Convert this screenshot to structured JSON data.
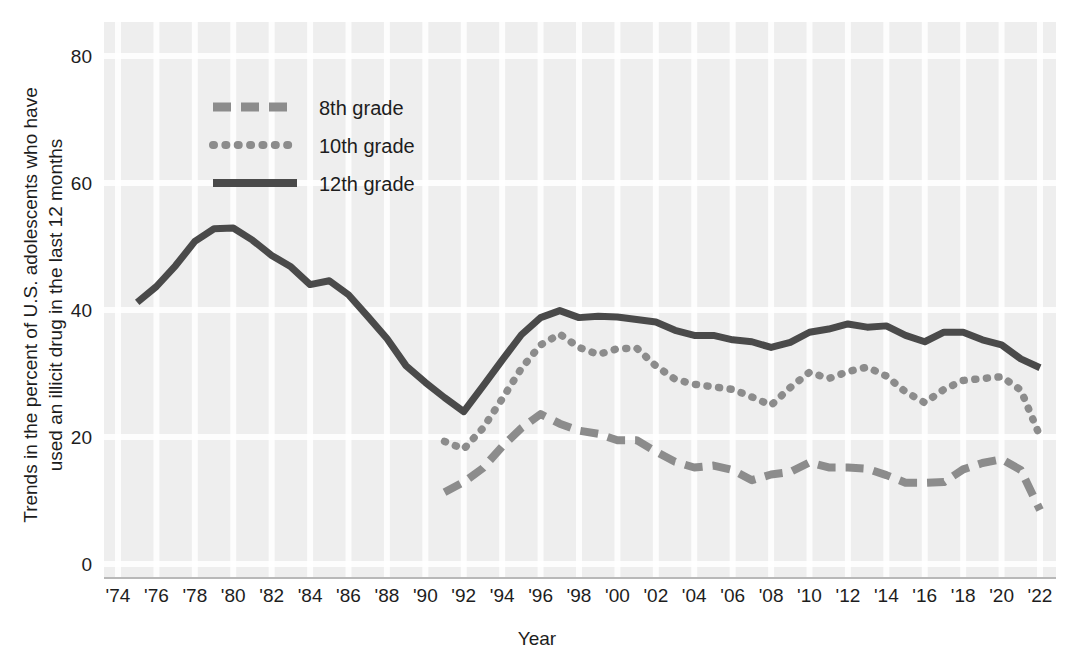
{
  "chart_data": {
    "type": "line",
    "title": "",
    "xlabel": "Year",
    "ylabel": "Trends in the percent of U.S. adolescents  who have used an illicit drug in the last 12 months",
    "ylabel_line1": "Trends in the percent of U.S. adolescents  who have",
    "ylabel_line2": "used an illicit drug in the last 12 months",
    "xlim": [
      1974,
      2022
    ],
    "ylim": [
      0,
      80
    ],
    "yticks": [
      0,
      20,
      40,
      60,
      80
    ],
    "ytick_labels": [
      "0",
      "20",
      "40",
      "60",
      "80"
    ],
    "xticks": [
      1974,
      1976,
      1978,
      1980,
      1982,
      1984,
      1986,
      1988,
      1990,
      1992,
      1994,
      1996,
      1998,
      2000,
      2002,
      2004,
      2006,
      2008,
      2010,
      2012,
      2014,
      2016,
      2018,
      2020,
      2022
    ],
    "xtick_labels": [
      "'74",
      "'76",
      "'78",
      "'80",
      "'82",
      "'84",
      "'86",
      "'88",
      "'90",
      "'92",
      "'94",
      "'96",
      "'98",
      "'00",
      "'02",
      "'04",
      "'06",
      "'08",
      "'10",
      "'12",
      "'14",
      "'16",
      "'18",
      "'20",
      "'22"
    ],
    "grid": true,
    "grid_color": "#ffffff",
    "plot_background": "#eeeeee",
    "legend_position": "top-left",
    "series": [
      {
        "name": "8th grade",
        "style": "dashed",
        "color": "#8c8c8c",
        "x": [
          1991,
          1992,
          1993,
          1994,
          1995,
          1996,
          1997,
          1998,
          1999,
          2000,
          2001,
          2002,
          2003,
          2004,
          2005,
          2006,
          2007,
          2008,
          2009,
          2010,
          2011,
          2012,
          2013,
          2014,
          2015,
          2016,
          2017,
          2018,
          2019,
          2020,
          2021,
          2022
        ],
        "values": [
          11.3,
          12.9,
          15.1,
          18.5,
          21.4,
          23.6,
          22.1,
          21.0,
          20.5,
          19.5,
          19.5,
          17.7,
          16.1,
          15.2,
          15.5,
          14.8,
          13.2,
          14.1,
          14.5,
          16.0,
          15.2,
          15.2,
          15.0,
          14.0,
          12.8,
          12.8,
          12.9,
          14.9,
          15.9,
          16.5,
          14.8,
          8.5
        ]
      },
      {
        "name": "10th grade",
        "style": "dotted",
        "color": "#8c8c8c",
        "x": [
          1991,
          1992,
          1993,
          1994,
          1995,
          1996,
          1997,
          1998,
          1999,
          2000,
          2001,
          2002,
          2003,
          2004,
          2005,
          2006,
          2007,
          2008,
          2009,
          2010,
          2011,
          2012,
          2013,
          2014,
          2015,
          2016,
          2017,
          2018,
          2019,
          2020,
          2021,
          2022
        ],
        "values": [
          19.3,
          18.1,
          21.4,
          26.0,
          30.8,
          34.5,
          36.2,
          34.1,
          33.0,
          33.9,
          34.0,
          31.2,
          29.1,
          28.3,
          27.9,
          27.5,
          26.3,
          25.0,
          27.8,
          30.2,
          29.2,
          30.3,
          31.0,
          29.6,
          27.1,
          25.4,
          27.5,
          28.9,
          29.2,
          29.5,
          27.4,
          20.1
        ]
      },
      {
        "name": "12th grade",
        "style": "solid",
        "color": "#4a4a4a",
        "x": [
          1975,
          1976,
          1977,
          1978,
          1979,
          1980,
          1981,
          1982,
          1983,
          1984,
          1985,
          1986,
          1987,
          1988,
          1989,
          1990,
          1991,
          1992,
          1993,
          1994,
          1995,
          1996,
          1997,
          1998,
          1999,
          2000,
          2001,
          2002,
          2003,
          2004,
          2005,
          2006,
          2007,
          2008,
          2009,
          2010,
          2011,
          2012,
          2013,
          2014,
          2015,
          2016,
          2017,
          2018,
          2019,
          2020,
          2021,
          2022
        ],
        "values": [
          41.2,
          43.7,
          47.0,
          50.8,
          52.8,
          52.9,
          51.0,
          48.6,
          46.8,
          44.0,
          44.6,
          42.4,
          39.0,
          35.5,
          31.2,
          28.6,
          26.2,
          24.0,
          28.0,
          32.1,
          36.1,
          38.8,
          39.9,
          38.8,
          39.0,
          38.9,
          38.5,
          38.1,
          36.8,
          36.0,
          36.0,
          35.3,
          35.0,
          34.1,
          34.9,
          36.5,
          37.0,
          37.8,
          37.3,
          37.5,
          36.0,
          35.0,
          36.5,
          36.5,
          35.3,
          34.5,
          32.3,
          30.9
        ]
      }
    ],
    "legend_entries": [
      {
        "label": "8th grade",
        "style": "dashed"
      },
      {
        "label": "10th grade",
        "style": "dotted"
      },
      {
        "label": "12th grade",
        "style": "solid"
      }
    ]
  }
}
